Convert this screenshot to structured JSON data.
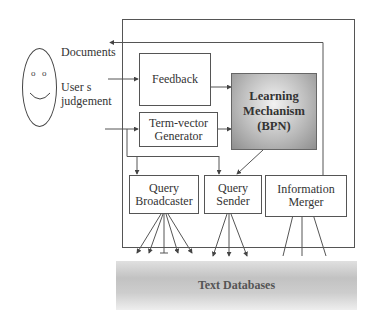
{
  "diagram": {
    "user": {
      "icon": "smiley-face-icon",
      "documents_label": "Documents",
      "judgement_label_line1": "User s",
      "judgement_label_line2": "judgement"
    },
    "boxes": {
      "feedback": "Feedback",
      "term_vector_line1": "Term-vector",
      "term_vector_line2": "Generator",
      "learning_line1": "Learning",
      "learning_line2": "Mechanism",
      "learning_line3": "(BPN)",
      "query_broadcaster_line1": "Query",
      "query_broadcaster_line2": "Broadcaster",
      "query_sender_line1": "Query",
      "query_sender_line2": "Sender",
      "info_merger_line1": "Information",
      "info_merger_line2": "Merger"
    },
    "databases": "Text Databases",
    "colors": {
      "line": "#555555",
      "learning_fill": "#a8a8a8",
      "db_fill": "#c8c8c8"
    }
  }
}
